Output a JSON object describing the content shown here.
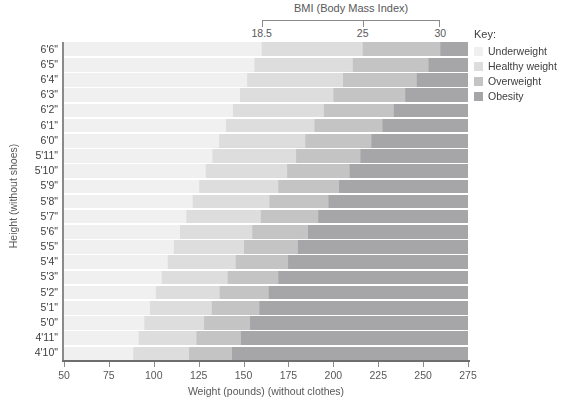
{
  "chart_data": {
    "type": "area",
    "title": "BMI (Body Mass Index)",
    "xlabel": "Weight (pounds) (without clothes)",
    "ylabel": "Height (without shoes)",
    "xlim": [
      50,
      275
    ],
    "xticks": [
      50,
      75,
      100,
      125,
      150,
      175,
      200,
      225,
      250,
      275
    ],
    "yticks": [
      "6'6\"",
      "6'5\"",
      "6'4\"",
      "6'3\"",
      "6'2\"",
      "6'1\"",
      "6'0\"",
      "5'11\"",
      "5'10\"",
      "5'9\"",
      "5'8\"",
      "5'7\"",
      "5'6\"",
      "5'5\"",
      "5'4\"",
      "5'3\"",
      "5'2\"",
      "5'1\"",
      "5'0\"",
      "4'11\"",
      "4'10\""
    ],
    "grid": true,
    "legend_position": "right",
    "bmi_scale": {
      "label": "BMI (Body Mass Index)",
      "ticks": [
        "18.5",
        "25",
        "30"
      ]
    },
    "bmi_thresholds": [
      18.5,
      25,
      30
    ],
    "series": [
      {
        "name": "Underweight",
        "bmi_range": [
          0,
          18.5
        ],
        "color": "#f0f0f0"
      },
      {
        "name": "Healthy weight",
        "bmi_range": [
          18.5,
          25
        ],
        "color": "#dddddd"
      },
      {
        "name": "Overweight",
        "bmi_range": [
          25,
          30
        ],
        "color": "#c4c4c4"
      },
      {
        "name": "Obesity",
        "bmi_range": [
          30,
          99
        ],
        "color": "#a6a6a8"
      }
    ],
    "heights_inches": [
      78,
      77,
      76,
      75,
      74,
      73,
      72,
      71,
      70,
      69,
      68,
      67,
      66,
      65,
      64,
      63,
      62,
      61,
      60,
      59,
      58
    ]
  },
  "axes": {
    "x_title": "Weight (pounds) (without clothes)",
    "y_title": "Height (without shoes)",
    "x_tick_labels": [
      "50",
      "75",
      "100",
      "125",
      "150",
      "175",
      "200",
      "225",
      "250",
      "275"
    ],
    "y_tick_labels": [
      "6'6\"",
      "6'5\"",
      "6'4\"",
      "6'3\"",
      "6'2\"",
      "6'1\"",
      "6'0\"",
      "5'11\"",
      "5'10\"",
      "5'9\"",
      "5'8\"",
      "5'7\"",
      "5'6\"",
      "5'5\"",
      "5'4\"",
      "5'3\"",
      "5'2\"",
      "5'1\"",
      "5'0\"",
      "4'11\"",
      "4'10\""
    ]
  },
  "bmi_header": {
    "title": "BMI (Body Mass Index)",
    "tick_labels": [
      "18.5",
      "25",
      "30"
    ]
  },
  "key": {
    "title": "Key:",
    "items": [
      {
        "label": "Underweight",
        "color": "#f0f0f0"
      },
      {
        "label": "Healthy weight",
        "color": "#dddddd"
      },
      {
        "label": "Overweight",
        "color": "#c4c4c4"
      },
      {
        "label": "Obesity",
        "color": "#a6a6a8"
      }
    ]
  },
  "colors": {
    "underweight": "#f0f0f0",
    "healthy": "#dddddd",
    "overweight": "#c4c4c4",
    "obesity": "#a6a6a8",
    "axis": "#8a8a8c",
    "text": "#58585a",
    "gridline": "#ffffff"
  }
}
